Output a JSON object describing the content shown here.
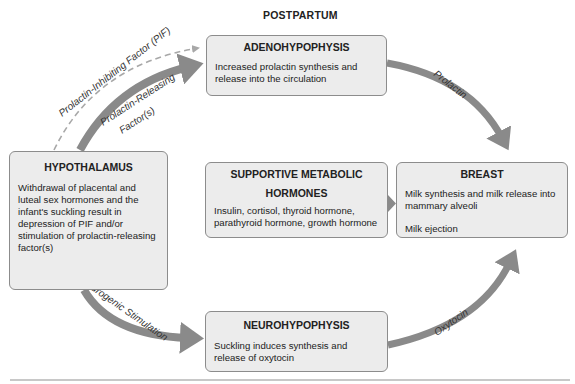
{
  "title": "POSTPARTUM",
  "boxes": {
    "adenohypophysis": {
      "heading": "ADENOHYPOPHYSIS",
      "text": "Increased prolactin synthesis and release into the circulation"
    },
    "hypothalamus": {
      "heading": "HYPOTHALAMUS",
      "text": "Withdrawal of placental and luteal sex hormones and the infant's suckling result in depression of PIF and/or stimulation of prolactin-releasing factor(s)"
    },
    "supportive": {
      "heading_line1": "SUPPORTIVE METABOLIC",
      "heading_line2": "HORMONES",
      "text": "Insulin, cortisol, thyroid hormone, parathyroid hormone, growth hormone"
    },
    "breast": {
      "heading": "BREAST",
      "text1": "Milk synthesis and milk release into mammary alveoli",
      "text2": "Milk ejection"
    },
    "neurohypophysis": {
      "heading": "NEUROHYPOPHYSIS",
      "text": "Suckling induces synthesis and release of oxytocin"
    }
  },
  "arrows": {
    "pif": "Prolactin-Inhibiting Factor (PIF)",
    "prf_line1": "Prolactin-Releasing",
    "prf_line2": "Factor(s)",
    "prolactin": "Prolactin",
    "neurogenic": "Neurogenic Stimulation",
    "oxytocin": "Oxytocin"
  },
  "colors": {
    "box_fill": "#ececec",
    "box_border": "#8c8c8c",
    "arrow": "#8a8a8a",
    "dashed_arrow": "#a8a8a8"
  }
}
